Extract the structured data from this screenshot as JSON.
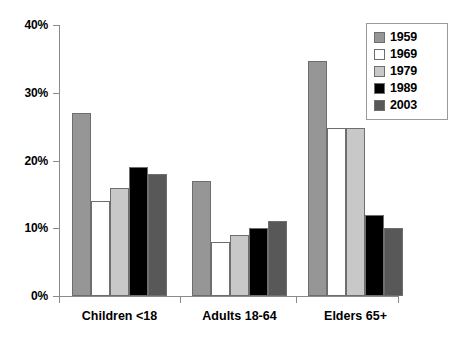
{
  "chart_data": {
    "type": "bar",
    "title": "",
    "subtitle": "",
    "xlabel": "",
    "ylabel": "",
    "categories": [
      "Children <18",
      "Adults 18-64",
      "Elders 65+"
    ],
    "series": [
      {
        "name": "1959",
        "color": "#969696",
        "values": [
          27,
          17,
          34.7
        ]
      },
      {
        "name": "1969",
        "color": "#ffffff",
        "values": [
          14,
          8,
          24.8
        ]
      },
      {
        "name": "1979",
        "color": "#c8c8c8",
        "values": [
          16,
          9,
          24.8
        ]
      },
      {
        "name": "1989",
        "color": "#000000",
        "values": [
          19,
          10,
          12
        ]
      },
      {
        "name": "2003",
        "color": "#585858",
        "values": [
          18,
          11,
          10
        ]
      }
    ],
    "ylim": [
      0,
      40
    ],
    "ytick_values": [
      0,
      10,
      20,
      30,
      40
    ],
    "ytick_labels": [
      "0%",
      "10%",
      "20%",
      "30%",
      "40%"
    ],
    "grid": false,
    "legend_position": "top-right"
  },
  "axis": {
    "y_ticks": [
      {
        "label": "40%",
        "value": 40
      },
      {
        "label": "30%",
        "value": 30
      },
      {
        "label": "20%",
        "value": 20
      },
      {
        "label": "10%",
        "value": 10
      },
      {
        "label": "0%",
        "value": 0
      }
    ]
  },
  "legend": {
    "items": [
      {
        "label": "1959",
        "color": "#969696"
      },
      {
        "label": "1969",
        "color": "#ffffff"
      },
      {
        "label": "1979",
        "color": "#c8c8c8"
      },
      {
        "label": "1989",
        "color": "#000000"
      },
      {
        "label": "2003",
        "color": "#585858"
      }
    ]
  },
  "categories": [
    {
      "label": "Children <18"
    },
    {
      "label": "Adults 18-64"
    },
    {
      "label": "Elders 65+"
    }
  ]
}
